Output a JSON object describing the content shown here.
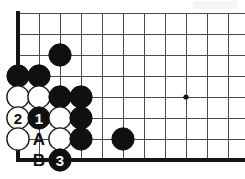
{
  "figure": {
    "kind": "go-board-diagram",
    "width": 245,
    "height": 179
  },
  "board": {
    "origin_x": 18,
    "origin_y": 13,
    "spacing": 21,
    "columns": 11,
    "rows": 8,
    "edges": {
      "left": "thick",
      "bottom": "thick",
      "top": "thin",
      "right": "open"
    },
    "colors": {
      "grid": "#4a4a4a",
      "border": "#141414",
      "black_stone": "#101010",
      "white_stone": "#ffffff",
      "background": "#ffffff"
    },
    "star_points": [
      {
        "col": 9,
        "row": 5
      }
    ]
  },
  "stones": [
    {
      "col": 3,
      "row": 3,
      "color": "black",
      "label": ""
    },
    {
      "col": 1,
      "row": 4,
      "color": "black",
      "label": ""
    },
    {
      "col": 2,
      "row": 4,
      "color": "black",
      "label": ""
    },
    {
      "col": 1,
      "row": 5,
      "color": "white",
      "label": ""
    },
    {
      "col": 2,
      "row": 5,
      "color": "white",
      "label": ""
    },
    {
      "col": 3,
      "row": 5,
      "color": "black",
      "label": ""
    },
    {
      "col": 4,
      "row": 5,
      "color": "black",
      "label": ""
    },
    {
      "col": 1,
      "row": 6,
      "color": "white",
      "label": "2"
    },
    {
      "col": 2,
      "row": 6,
      "color": "black",
      "label": "1"
    },
    {
      "col": 3,
      "row": 6,
      "color": "white",
      "label": ""
    },
    {
      "col": 4,
      "row": 6,
      "color": "black",
      "label": ""
    },
    {
      "col": 1,
      "row": 7,
      "color": "white",
      "label": ""
    },
    {
      "col": 3,
      "row": 7,
      "color": "white",
      "label": ""
    },
    {
      "col": 4,
      "row": 7,
      "color": "black",
      "label": ""
    },
    {
      "col": 6,
      "row": 7,
      "color": "black",
      "label": ""
    },
    {
      "col": 3,
      "row": 8,
      "color": "black",
      "label": "3"
    }
  ],
  "point_labels": [
    {
      "col": 2,
      "row": 7,
      "text": "A"
    },
    {
      "col": 2,
      "row": 8,
      "text": "B"
    }
  ],
  "move_numbers": {
    "1": {
      "color": "black",
      "text": "1"
    },
    "2": {
      "color": "white",
      "text": "2"
    },
    "3": {
      "color": "black",
      "text": "3"
    }
  }
}
